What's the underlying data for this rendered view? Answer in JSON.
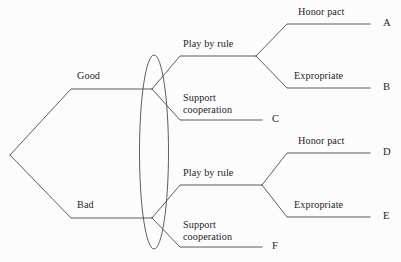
{
  "figure": {
    "type": "game-tree-diagram",
    "width": 401,
    "height": 262,
    "background_color": "#fcfcfc",
    "line_color": "#4a4a52",
    "text_color": "#24242c"
  },
  "nodes": {
    "root_label": "",
    "nature_branches": [
      {
        "id": "good",
        "label": "Good"
      },
      {
        "id": "bad",
        "label": "Bad"
      }
    ]
  },
  "information_set": {
    "shape": "ellipse",
    "label": "",
    "encloses": [
      "good-decision-node",
      "bad-decision-node"
    ]
  },
  "branches": {
    "good": {
      "play_by_rule": "Play by rule",
      "support_cooperation_line1": "Support",
      "support_cooperation_line2": "cooperation",
      "honor_pact": "Honor pact",
      "expropriate": "Expropriate"
    },
    "bad": {
      "play_by_rule": "Play by rule",
      "support_cooperation_line1": "Support",
      "support_cooperation_line2": "cooperation",
      "honor_pact": "Honor pact",
      "expropriate": "Expropriate"
    }
  },
  "outcomes": [
    {
      "id": "A",
      "label": "A",
      "path": "Good / Play by rule / Honor pact"
    },
    {
      "id": "B",
      "label": "B",
      "path": "Good / Play by rule / Expropriate"
    },
    {
      "id": "C",
      "label": "C",
      "path": "Good / Support cooperation"
    },
    {
      "id": "D",
      "label": "D",
      "path": "Bad / Play by rule / Honor pact"
    },
    {
      "id": "E",
      "label": "E",
      "path": "Bad / Play by rule / Expropriate"
    },
    {
      "id": "F",
      "label": "F",
      "path": "Bad / Support cooperation"
    }
  ]
}
